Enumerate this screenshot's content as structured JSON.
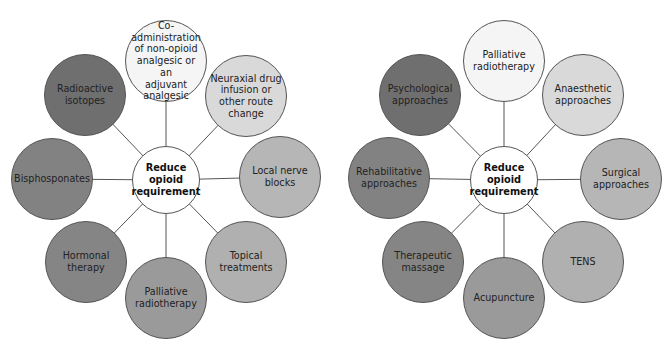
{
  "colors": {
    "darkest": "#6f6f6f",
    "dark": "#828282",
    "mid": "#9a9a9a",
    "lighter": "#b6b6b6",
    "light": "#d9d9d9",
    "white": "#f5f5f5",
    "line": "#555555"
  },
  "diagrams": [
    {
      "center": {
        "label": "Reduce\nopioid\nrequirement",
        "x": 166,
        "y": 180,
        "r": 34
      },
      "nodes": [
        {
          "label": "Co-administration\nof non-opioid\nanalgesic or an\nadjuvant analgesic",
          "x": 166,
          "y": 61,
          "r": 41,
          "color": "#f5f5f5"
        },
        {
          "label": "Neuraxial drug\ninfusion or\nother route\nchange",
          "x": 246,
          "y": 96,
          "r": 41,
          "color": "#d9d9d9"
        },
        {
          "label": "Local nerve\nblocks",
          "x": 280,
          "y": 177,
          "r": 41,
          "color": "#b6b6b6"
        },
        {
          "label": "Topical\ntreatments",
          "x": 246,
          "y": 262,
          "r": 41,
          "color": "#b0b0b0"
        },
        {
          "label": "Palliative\nradiotherapy",
          "x": 166,
          "y": 298,
          "r": 41,
          "color": "#9a9a9a"
        },
        {
          "label": "Hormonal\ntherapy",
          "x": 86,
          "y": 262,
          "r": 41,
          "color": "#858585"
        },
        {
          "label": "Bisphosponates",
          "x": 52,
          "y": 179,
          "r": 41,
          "color": "#828282"
        },
        {
          "label": "Radioactive\nisotopes",
          "x": 85,
          "y": 95,
          "r": 41,
          "color": "#6f6f6f"
        }
      ]
    },
    {
      "center": {
        "label": "Reduce\nopioid\nrequirement",
        "x": 504,
        "y": 180,
        "r": 34
      },
      "nodes": [
        {
          "label": "Palliative\nradiotherapy",
          "x": 504,
          "y": 61,
          "r": 41,
          "color": "#f5f5f5"
        },
        {
          "label": "Anaesthetic\napproaches",
          "x": 583,
          "y": 95,
          "r": 41,
          "color": "#d9d9d9"
        },
        {
          "label": "Surgical\napproaches",
          "x": 621,
          "y": 179,
          "r": 41,
          "color": "#b6b6b6"
        },
        {
          "label": "TENS",
          "x": 583,
          "y": 262,
          "r": 41,
          "color": "#b0b0b0"
        },
        {
          "label": "Acupuncture",
          "x": 504,
          "y": 298,
          "r": 41,
          "color": "#9a9a9a"
        },
        {
          "label": "Therapeutic\nmassage",
          "x": 423,
          "y": 262,
          "r": 41,
          "color": "#858585"
        },
        {
          "label": "Rehabilitative\napproaches",
          "x": 389,
          "y": 178,
          "r": 41,
          "color": "#828282"
        },
        {
          "label": "Psychological\napproaches",
          "x": 420,
          "y": 95,
          "r": 41,
          "color": "#6f6f6f"
        }
      ]
    }
  ]
}
